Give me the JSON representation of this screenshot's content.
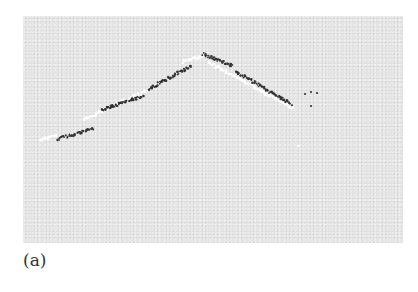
{
  "figure": {
    "panel_label": "(a)",
    "background_color": "#e4e4e4",
    "dark_dot_color": "#333333",
    "light_dot_color": "#ffffff"
  },
  "dark_segments": [
    {
      "x1": 34,
      "y1": 123,
      "x2": 70,
      "y2": 113
    },
    {
      "x1": 78,
      "y1": 94,
      "x2": 120,
      "y2": 80
    },
    {
      "x1": 126,
      "y1": 73,
      "x2": 168,
      "y2": 50
    },
    {
      "x1": 180,
      "y1": 38,
      "x2": 210,
      "y2": 50
    },
    {
      "x1": 212,
      "y1": 55,
      "x2": 268,
      "y2": 88
    }
  ],
  "light_segments": [
    {
      "x1": 17,
      "y1": 124,
      "x2": 34,
      "y2": 119
    },
    {
      "x1": 60,
      "y1": 104,
      "x2": 125,
      "y2": 74
    },
    {
      "x1": 160,
      "y1": 46,
      "x2": 185,
      "y2": 38
    },
    {
      "x1": 185,
      "y1": 46,
      "x2": 270,
      "y2": 92
    }
  ],
  "stray_dots": [
    {
      "x": 282,
      "y": 78
    },
    {
      "x": 288,
      "y": 76
    },
    {
      "x": 294,
      "y": 77
    },
    {
      "x": 288,
      "y": 90
    },
    {
      "x": 275,
      "y": 130
    }
  ]
}
